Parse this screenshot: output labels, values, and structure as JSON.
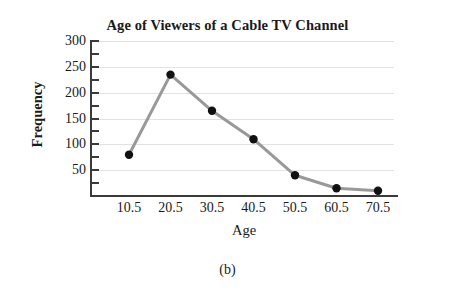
{
  "figure": {
    "caption": "(b)"
  },
  "chart_data": {
    "type": "line",
    "title": "Age of Viewers of a Cable TV Channel",
    "xlabel": "Age",
    "ylabel": "Frequency",
    "categories": [
      "10.5",
      "20.5",
      "30.5",
      "40.5",
      "50.5",
      "60.5",
      "70.5"
    ],
    "values": [
      80,
      235,
      165,
      110,
      40,
      15,
      10
    ],
    "ylim": [
      0,
      300
    ],
    "ytick_labels": [
      "300",
      "250",
      "200",
      "150",
      "100",
      "50"
    ],
    "yticks": [
      300,
      250,
      200,
      150,
      100,
      50
    ],
    "yminor_ticks": [
      275,
      225,
      175,
      125,
      75,
      25
    ],
    "grid": "horizontal",
    "legend": "none",
    "series_color": "#999999",
    "marker_color": "#111111",
    "grid_color": "#e2e2e2",
    "axis_color": "#3a3a3a",
    "background": "#ffffff"
  }
}
